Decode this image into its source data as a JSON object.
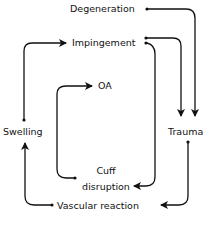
{
  "diagram": {
    "nodes": [
      {
        "id": "degeneration",
        "label": "Degeneration"
      },
      {
        "id": "impingement",
        "label": "Impingement"
      },
      {
        "id": "oa",
        "label": "OA"
      },
      {
        "id": "swelling",
        "label": "Swelling"
      },
      {
        "id": "trauma",
        "label": "Trauma"
      },
      {
        "id": "cuff_disruption",
        "label_line1": "Cuff",
        "label_line2": "disruption"
      },
      {
        "id": "vascular_reaction",
        "label": "Vascular reaction"
      }
    ],
    "edges": [
      {
        "from": "Degeneration",
        "to": "Trauma"
      },
      {
        "from": "Impingement",
        "to": "Trauma"
      },
      {
        "from": "Impingement",
        "to": "Cuff disruption"
      },
      {
        "from": "Cuff disruption",
        "to": "OA"
      },
      {
        "from": "Trauma",
        "to": "Vascular reaction"
      },
      {
        "from": "Vascular reaction",
        "to": "Swelling"
      },
      {
        "from": "Swelling",
        "to": "Impingement"
      }
    ],
    "colors": {
      "line": "#111111",
      "background": "#ffffff"
    }
  }
}
